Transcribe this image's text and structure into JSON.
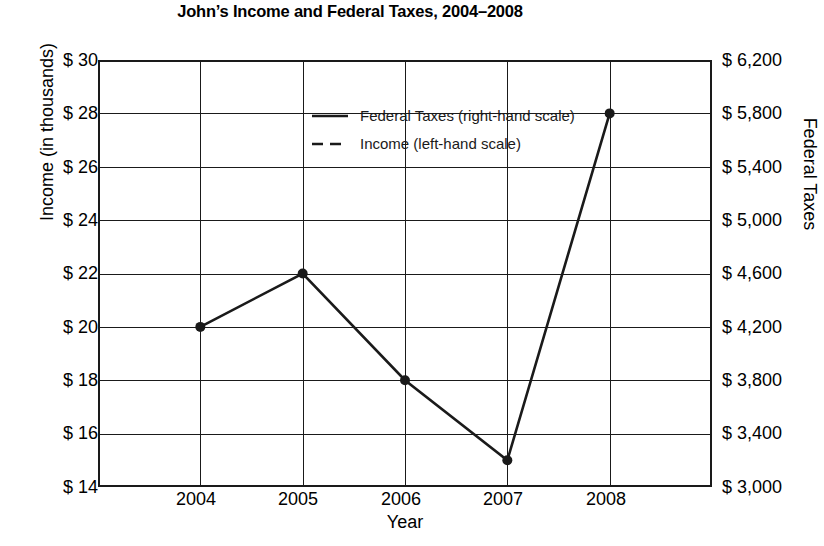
{
  "chart_data": {
    "type": "line",
    "title": "John’s Income and Federal Taxes, 2004–2008",
    "xlabel": "Year",
    "ylabel": "Income (in thousands)",
    "ylabel_right": "Federal Taxes",
    "categories": [
      "2004",
      "2005",
      "2006",
      "2007",
      "2008"
    ],
    "grid": true,
    "legend_position": "upper-center-left",
    "axis_left": {
      "label": "Income (in thousands)",
      "ticks": [
        "$ 30",
        "$ 28",
        "$ 26",
        "$ 24",
        "$ 22",
        "$ 20",
        "$ 18",
        "$ 16",
        "$ 14"
      ],
      "tick_values": [
        30,
        28,
        26,
        24,
        22,
        20,
        18,
        16,
        14
      ],
      "ylim": [
        14,
        30
      ],
      "step": 2,
      "units": "thousands of dollars"
    },
    "axis_right": {
      "label": "Federal Taxes",
      "ticks": [
        "$ 6,200",
        "$ 5,800",
        "$ 5,400",
        "$ 5,000",
        "$ 4,600",
        "$ 4,200",
        "$ 3,800",
        "$ 3,400",
        "$ 3,000"
      ],
      "tick_values": [
        6200,
        5800,
        5400,
        5000,
        4600,
        4200,
        3800,
        3400,
        3000
      ],
      "ylim": [
        3000,
        6200
      ],
      "step": 400,
      "units": "dollars"
    },
    "series": [
      {
        "name": "Federal Taxes (right-hand scale)",
        "short_name": "Federal Taxes",
        "scale": "right",
        "style": "solid",
        "color": "#1a1a1a",
        "marker": "circle",
        "values": [
          4200,
          4600,
          3800,
          3200,
          5800
        ]
      },
      {
        "name": "Income (left-hand scale)",
        "short_name": "Income",
        "scale": "left",
        "style": "dashed",
        "color": "#1a1a1a",
        "marker": "circle",
        "values": [
          19000,
          18000,
          20000,
          17600,
          24000
        ]
      }
    ],
    "legend": [
      {
        "label": "Federal Taxes (right-hand scale)",
        "style": "solid"
      },
      {
        "label": "Income (left-hand scale)",
        "style": "dashed"
      }
    ]
  }
}
